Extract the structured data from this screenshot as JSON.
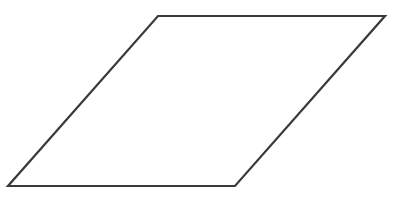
{
  "diagram": {
    "shape": "parallelogram",
    "stroke_color": "#3a3a3a",
    "fill_color": "#ffffff",
    "background_color": "#ffffff",
    "stroke_width": 2.2,
    "vertices": [
      {
        "x": 158,
        "y": 16
      },
      {
        "x": 385,
        "y": 16
      },
      {
        "x": 235,
        "y": 186
      },
      {
        "x": 8,
        "y": 186
      }
    ],
    "points_attr": "158,16 385,16 235,186 8,186"
  }
}
